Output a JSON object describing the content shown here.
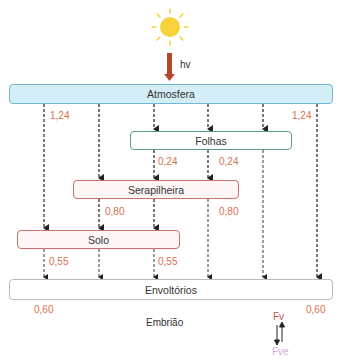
{
  "diagram": {
    "light_label": "hv",
    "boxes": {
      "atmosfera": "Atmosfera",
      "folhas": "Folhas",
      "serapilheira": "Serapilheira",
      "solo": "Solo",
      "envoltorios": "Envoltórios",
      "embriao": "Embrião"
    },
    "values": {
      "atm_left": "1,24",
      "atm_right": "1,24",
      "folhas_left": "0,24",
      "folhas_right": "0,24",
      "sera_left": "0,80",
      "sera_right": "0,80",
      "solo_left": "0,55",
      "solo_right": "0,55",
      "env_left": "0,60",
      "env_right": "0,60"
    },
    "phytochrome": {
      "fv": "Fv",
      "fve": "Fve"
    },
    "colors": {
      "sun": "#f7d23a",
      "light_arrow": "#b5482a",
      "atmosfera_fill": "#d4eef7",
      "folhas_border": "#5a9e84",
      "serapilheira_border": "#c9706a",
      "value_text": "#d9714f",
      "fve_text": "#d7a9e0"
    }
  }
}
